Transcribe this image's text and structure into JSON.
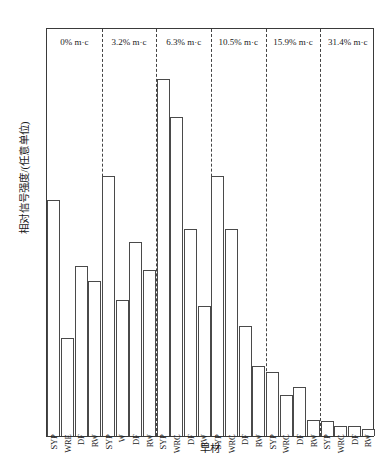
{
  "chart_data": {
    "type": "bar",
    "title": "",
    "xlabel": "早材",
    "ylabel": "相对信号强度/(任意单位)",
    "ylim": [
      0,
      3.0
    ],
    "yticks": [
      0,
      0.5,
      1.0,
      1.5,
      2.0,
      2.5,
      3.0
    ],
    "ytick_labels": [
      "0",
      "",
      "1.0",
      "",
      "2.0",
      "",
      "3.0"
    ],
    "grid": false,
    "legend": "none",
    "group_label_suffix": "m·c",
    "groups": [
      {
        "label": "0% m·c",
        "moisture_content": "0%",
        "categories": [
          "SYP",
          "WRE",
          "DF",
          "RW"
        ],
        "values": [
          1.73,
          0.72,
          1.25,
          1.14
        ]
      },
      {
        "label": "3.2% m·c",
        "moisture_content": "3.2%",
        "categories": [
          "SYP",
          "W",
          "DF",
          "RW"
        ],
        "values": [
          1.91,
          1.0,
          1.42,
          1.22
        ]
      },
      {
        "label": "6.3% m·c",
        "moisture_content": "6.3%",
        "categories": [
          "SYP",
          "WRC",
          "DF",
          "RW"
        ],
        "values": [
          2.62,
          2.34,
          1.52,
          0.95
        ]
      },
      {
        "label": "10.5% m·c",
        "moisture_content": "10.5%",
        "categories": [
          "SYP",
          "WRC",
          "DF",
          "RW"
        ],
        "values": [
          1.91,
          1.52,
          0.81,
          0.51
        ]
      },
      {
        "label": "15.9% m·c",
        "moisture_content": "15.9%",
        "categories": [
          "SYP",
          "WRC",
          "DF",
          "RW"
        ],
        "values": [
          0.47,
          0.3,
          0.36,
          0.12
        ]
      },
      {
        "label": "31.4% m·c",
        "moisture_content": "31.4%",
        "categories": [
          "SYP",
          "WRC",
          "DF",
          "RW"
        ],
        "values": [
          0.11,
          0.07,
          0.07,
          0.05
        ]
      }
    ]
  }
}
